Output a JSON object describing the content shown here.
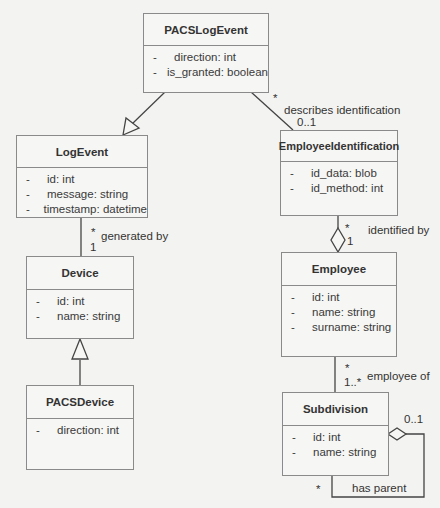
{
  "diagram": {
    "type": "UML class diagram",
    "classes": {
      "pacs_log_event": {
        "name": "PACSLogEvent",
        "attributes": [
          {
            "visibility": "-",
            "text": "direction: int"
          },
          {
            "visibility": "-",
            "text": "is_granted: boolean"
          }
        ]
      },
      "log_event": {
        "name": "LogEvent",
        "attributes": [
          {
            "visibility": "-",
            "text": "id: int"
          },
          {
            "visibility": "-",
            "text": "message: string"
          },
          {
            "visibility": "-",
            "text": "timestamp: datetime"
          }
        ]
      },
      "employee_identification": {
        "name": "EmployeeIdentification",
        "attributes": [
          {
            "visibility": "-",
            "text": "id_data: blob"
          },
          {
            "visibility": "-",
            "text": "id_method: int"
          }
        ]
      },
      "device": {
        "name": "Device",
        "attributes": [
          {
            "visibility": "-",
            "text": "id: int"
          },
          {
            "visibility": "-",
            "text": "name: string"
          }
        ]
      },
      "employee": {
        "name": "Employee",
        "attributes": [
          {
            "visibility": "-",
            "text": "id: int"
          },
          {
            "visibility": "-",
            "text": "name: string"
          },
          {
            "visibility": "-",
            "text": "surname: string"
          }
        ]
      },
      "pacs_device": {
        "name": "PACSDevice",
        "attributes": [
          {
            "visibility": "-",
            "text": "direction: int"
          }
        ]
      },
      "subdivision": {
        "name": "Subdivision",
        "attributes": [
          {
            "visibility": "-",
            "text": "id: int"
          },
          {
            "visibility": "-",
            "text": "name: string"
          }
        ]
      }
    },
    "relationships": {
      "pacslogevent_inherits_logevent": {
        "kind": "generalization",
        "from": "PACSLogEvent",
        "to": "LogEvent"
      },
      "describes_identification": {
        "kind": "association",
        "from": "PACSLogEvent",
        "to": "EmployeeIdentification",
        "label": "describes identification",
        "from_mult": "*",
        "to_mult": "0..1"
      },
      "generated_by": {
        "kind": "association",
        "from": "LogEvent",
        "to": "Device",
        "label": "generated by",
        "from_mult": "*",
        "to_mult": "1"
      },
      "pacsdevice_inherits_device": {
        "kind": "generalization",
        "from": "PACSDevice",
        "to": "Device"
      },
      "identified_by": {
        "kind": "aggregation",
        "from": "EmployeeIdentification",
        "to": "Employee",
        "label": "identified by",
        "from_mult": "*",
        "to_mult": "1"
      },
      "employee_of": {
        "kind": "association",
        "from": "Employee",
        "to": "Subdivision",
        "label": "employee of",
        "from_mult": "*",
        "to_mult": "1..*"
      },
      "has_parent": {
        "kind": "aggregation",
        "from": "Subdivision",
        "to": "Subdivision",
        "label": "has parent",
        "from_mult": "*",
        "to_mult": "0..1"
      }
    }
  }
}
